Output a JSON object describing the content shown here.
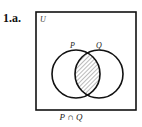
{
  "problem_label": "1.a.",
  "universe_label": "U",
  "sets": [
    {
      "name": "P",
      "cx": 76,
      "cy": 74,
      "r": 24
    },
    {
      "name": "Q",
      "cx": 99,
      "cy": 74,
      "r": 24
    }
  ],
  "shaded_region": "intersection",
  "caption": "P ∩ Q",
  "colors": {
    "stroke": "#111111",
    "hatch": "#555555",
    "background": "#ffffff"
  }
}
